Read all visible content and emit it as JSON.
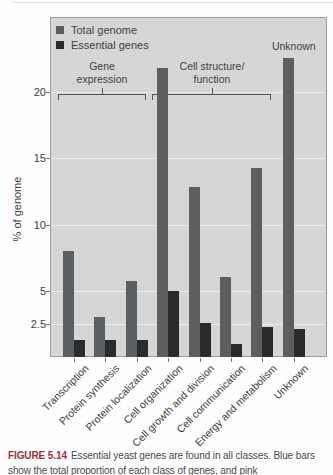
{
  "style": {
    "panel_bg": "#d6d6d6",
    "panel_border": "#9c9c9c",
    "grid_color": "#eaeaea",
    "text_color": "#3f3f3f",
    "tick_color": "#777777",
    "bracket_color": "#555555",
    "figure_label_color": "#9e3338",
    "total_bar_color": "#5c5f61",
    "essential_bar_color": "#2b2b2b"
  },
  "chart_data": {
    "type": "bar",
    "title": "",
    "ylabel": "% of genome",
    "yticks": [
      2.5,
      5,
      10,
      15,
      20
    ],
    "ytick_labels": [
      "2.5",
      "5",
      "10",
      "15",
      "20"
    ],
    "ylim": [
      0,
      25.7
    ],
    "grid": true,
    "legend_position": "top-left",
    "categories": [
      "Transcription",
      "Protein synthesis",
      "Protein localization",
      "Cell organization",
      "Cell growth and division",
      "Cell communication",
      "Energy and metabolism",
      "Unknown"
    ],
    "series": [
      {
        "name": "Total genome",
        "color": "#5c5f61",
        "values": [
          8.0,
          3.0,
          5.7,
          21.8,
          12.8,
          6.0,
          14.3,
          22.6
        ]
      },
      {
        "name": "Essential genes",
        "color": "#2b2b2b",
        "values": [
          1.3,
          1.3,
          1.3,
          5.0,
          2.6,
          1.0,
          2.3,
          2.1
        ]
      }
    ],
    "group_brackets": [
      {
        "label": "Gene expression",
        "lines": [
          "Gene",
          "expression"
        ],
        "from_category": 0,
        "to_category": 2
      },
      {
        "label": "Cell structure/function",
        "lines": [
          "Cell structure/",
          "function"
        ],
        "from_category": 3,
        "to_category": 6
      }
    ],
    "bar_annotation": {
      "label": "Unknown",
      "category": 7
    }
  },
  "caption": {
    "label": "FIGURE 5.14",
    "text": "Essential yeast genes are found in all classes. Blue bars show the total proportion of each class of genes, and pink"
  }
}
